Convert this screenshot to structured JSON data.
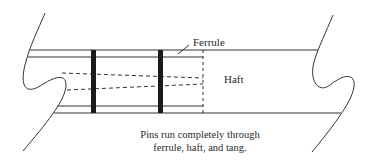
{
  "diagram": {
    "labels": {
      "ferrule": "Ferrule",
      "haft": "Haft"
    },
    "caption": {
      "line1": "Pins run completely through",
      "line2": "ferrule, haft, and tang."
    },
    "colors": {
      "line": "#333333",
      "pin": "#1a1a1a",
      "background": "#ffffff"
    }
  }
}
